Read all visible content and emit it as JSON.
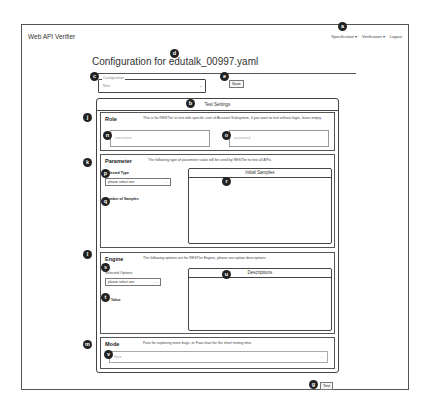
{
  "app": {
    "title": "Web API Verifier"
  },
  "nav": {
    "items": [
      {
        "label": "Specification",
        "caret": "▾"
      },
      {
        "label": "Verification",
        "caret": "▾"
      },
      {
        "label": "Logout"
      }
    ]
  },
  "page": {
    "title": "Configuration for edutalk_00997.yaml"
  },
  "config_select": {
    "label": "Configuration",
    "value": "New",
    "caret": "⌄"
  },
  "save_button": {
    "label": "Save"
  },
  "test_settings": {
    "title": "Test Settings",
    "role": {
      "title": "Role",
      "description": "This is for RESTler to test with specific user of Account Subsystem, if you want to test without login, leave empty.",
      "username_placeholder": "username",
      "password_placeholder": "password"
    },
    "parameter": {
      "title": "Parameter",
      "description": "The following type of parameter value will be used by RESTler to test all APIs.",
      "selected_type_label": "Selected Type",
      "selected_type_value": "please select one",
      "number_of_samples_label": "Number of Samples",
      "initial_samples_title": "Initial Samples"
    },
    "engine": {
      "title": "Engine",
      "description": "The following options are for RESTler Engine, please see option descriptions.",
      "selected_options_label": "Selected Options",
      "selected_options_value": "please select one",
      "value_label": "Value",
      "descriptions_title": "Descriptions"
    },
    "mode": {
      "title": "Mode",
      "description": "Fuzz for exploring more bugs, or Fuzz-lean for the short testing time.",
      "value": "Fuzz",
      "caret": "⌄"
    }
  },
  "test_button": {
    "label": "Test"
  },
  "markers": {
    "a": "a",
    "b": "b",
    "c": "c",
    "d": "d",
    "e": "e",
    "j": "j",
    "k": "k",
    "l": "l",
    "m": "m",
    "n": "n",
    "o": "o",
    "p": "p",
    "q": "q",
    "r": "r",
    "s": "s",
    "t": "t",
    "u": "u",
    "v": "v",
    "g": "g"
  }
}
